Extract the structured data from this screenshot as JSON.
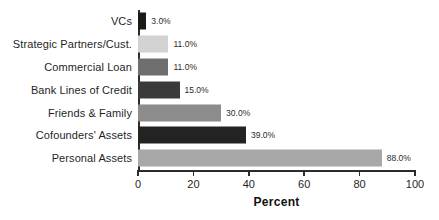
{
  "chart_data": {
    "type": "bar",
    "orientation": "horizontal",
    "title": "",
    "xlabel": "Percent",
    "ylabel": "",
    "xlim": [
      0,
      100
    ],
    "xticks": [
      0,
      20,
      40,
      60,
      80,
      100
    ],
    "grid": false,
    "legend": false,
    "categories": [
      "VCs",
      "Strategic Partners/Cust.",
      "Commercial Loan",
      "Bank Lines of Credit",
      "Friends & Family",
      "Cofounders' Assets",
      "Personal Assets"
    ],
    "values": [
      3.0,
      11.0,
      11.0,
      15.0,
      30.0,
      39.0,
      88.0
    ],
    "data_labels": [
      "3.0%",
      "11.0%",
      "11.0%",
      "15.0%",
      "30.0%",
      "39.0%",
      "88.0%"
    ],
    "bar_colors": [
      "#1a1a1a",
      "#d2d2d2",
      "#6e6e6e",
      "#3a3a3a",
      "#8c8c8c",
      "#232323",
      "#a8a8a8"
    ],
    "axis_color": "#2b2b2b",
    "background": "#ffffff"
  },
  "axis": {
    "tick_labels": [
      "0",
      "20",
      "40",
      "60",
      "80",
      "100"
    ],
    "title": "Percent"
  }
}
